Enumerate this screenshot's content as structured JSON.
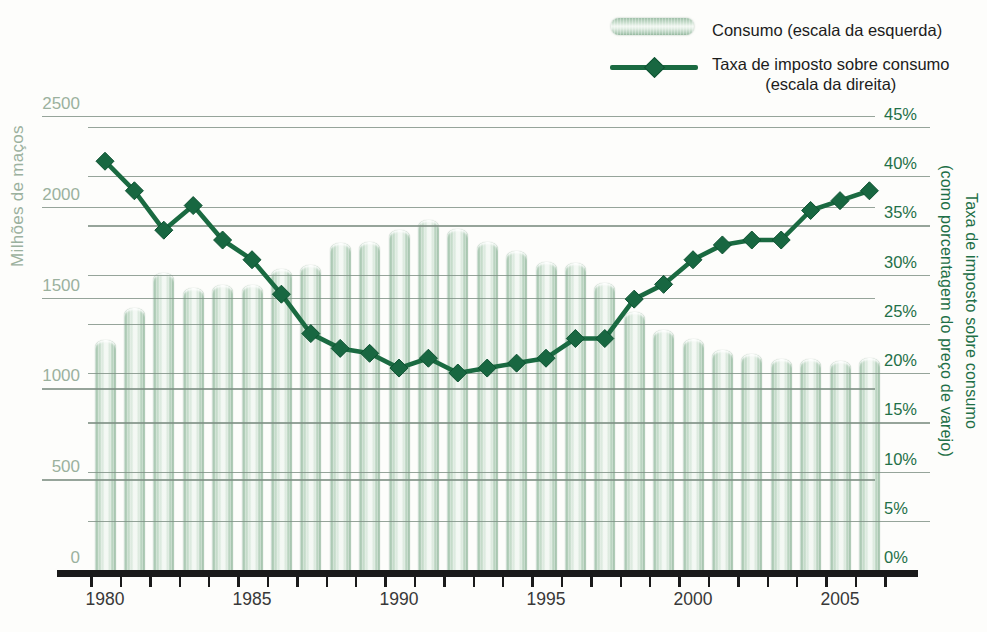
{
  "legend": {
    "items": [
      {
        "label": "Consumo (escala da esquerda)",
        "swatch": "bar-swatch"
      },
      {
        "label": "Taxa de imposto sobre consumo",
        "label2": "(escala da direita)",
        "swatch": "line-diamond-swatch"
      }
    ]
  },
  "left_axis": {
    "title": "Milhões de maços",
    "ticks": [
      "0",
      "500",
      "1000",
      "1500",
      "2000",
      "2500"
    ]
  },
  "right_axis": {
    "title_lines": [
      "Taxa de imposto sobre consumo",
      "(como porcentagem do preço de varejo)"
    ],
    "ticks": [
      "0%",
      "5%",
      "10%",
      "15%",
      "20%",
      "25%",
      "30%",
      "35%",
      "40%",
      "45%"
    ]
  },
  "x_axis": {
    "labels": [
      "1980",
      "1985",
      "1990",
      "1995",
      "2000",
      "2005"
    ]
  },
  "colors": {
    "bar_green_edge": "#9cbea6",
    "bar_green_highlight": "#f7faf7",
    "line_dark_green": "#1a6a41",
    "diamond_fill": "#186741",
    "left_label_sage": "#9bb19e",
    "right_label_green": "#1f7048",
    "gridline_gray": "#7c8d82",
    "axis_black": "#1a1a1a",
    "year_label_gray": "#383838"
  },
  "chart_data": {
    "type": "combo",
    "x": [
      1980,
      1981,
      1982,
      1983,
      1984,
      1985,
      1986,
      1987,
      1988,
      1989,
      1990,
      1991,
      1992,
      1993,
      1994,
      1995,
      1996,
      1997,
      1998,
      1999,
      2000,
      2001,
      2002,
      2003,
      2004,
      2005,
      2006
    ],
    "series": [
      {
        "name": "Consumo (escala da esquerda)",
        "type": "bar",
        "axis": "left",
        "unit": "milhões de maços",
        "values": [
          1265,
          1440,
          1635,
          1555,
          1570,
          1570,
          1655,
          1680,
          1800,
          1805,
          1870,
          1925,
          1880,
          1805,
          1755,
          1695,
          1690,
          1580,
          1420,
          1320,
          1270,
          1210,
          1190,
          1160,
          1160,
          1150,
          1170
        ]
      },
      {
        "name": "Taxa de imposto sobre consumo (escala da direita)",
        "type": "line",
        "axis": "right",
        "unit": "% do preço de varejo",
        "values": [
          41.5,
          38.5,
          34.5,
          37,
          33.5,
          31.5,
          28,
          24,
          22.5,
          22,
          20.5,
          21.5,
          20,
          20.5,
          21,
          21.5,
          23.5,
          23.5,
          27.5,
          29,
          31.5,
          33,
          33.5,
          33.5,
          36.5,
          37.5,
          38.5
        ]
      }
    ],
    "left_ylim": [
      0,
      2500
    ],
    "right_ylim": [
      0,
      45
    ],
    "grid": true,
    "legend_position": "top-right"
  }
}
